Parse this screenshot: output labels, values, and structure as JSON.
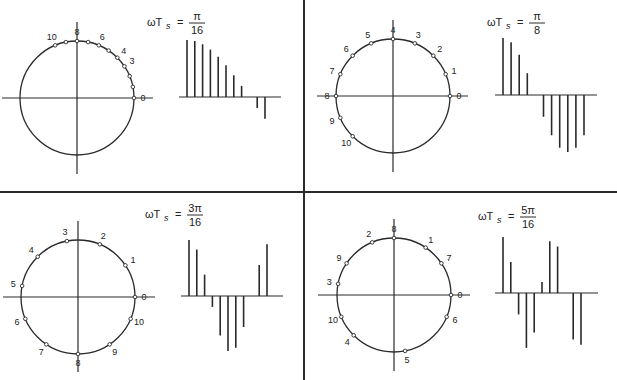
{
  "figure": {
    "colors": {
      "ink": "#2a2a2a",
      "background": "#ffffff"
    }
  },
  "panels": [
    {
      "id": "top-left",
      "title": {
        "lhs": "ωT",
        "sub": "s",
        "eq": "=",
        "num": "π",
        "den": "16"
      },
      "omega_ts_over_pi": 0.0625,
      "samples": [
        0,
        1,
        2,
        3,
        4,
        5,
        6,
        7,
        8,
        9,
        10
      ],
      "point_labels": [
        "0",
        "3",
        "4",
        "6",
        "8",
        "10"
      ],
      "point_label_indices": [
        0,
        3,
        4,
        6,
        8,
        10
      ],
      "stem_values": [
        1.0,
        0.981,
        0.924,
        0.831,
        0.707,
        0.556,
        0.383,
        0.195,
        0.0,
        -0.195,
        -0.383
      ]
    },
    {
      "id": "top-right",
      "title": {
        "lhs": "ωT",
        "sub": "s",
        "eq": "=",
        "num": "π",
        "den": "8"
      },
      "omega_ts_over_pi": 0.125,
      "samples": [
        0,
        1,
        2,
        3,
        4,
        5,
        6,
        7,
        8,
        9,
        10
      ],
      "point_labels": [
        "0",
        "1",
        "2",
        "3",
        "4",
        "5",
        "6",
        "7",
        "8",
        "9",
        "10"
      ],
      "point_label_indices": [
        0,
        1,
        2,
        3,
        4,
        5,
        6,
        7,
        8,
        9,
        10
      ],
      "stem_values": [
        1.0,
        0.924,
        0.707,
        0.383,
        0.0,
        -0.383,
        -0.707,
        -0.924,
        -1.0,
        -0.924,
        -0.707
      ]
    },
    {
      "id": "bottom-left",
      "title": {
        "lhs": "ωT",
        "sub": "s",
        "eq": "=",
        "num": "3π",
        "den": "16"
      },
      "omega_ts_over_pi": 0.1875,
      "samples": [
        0,
        1,
        2,
        3,
        4,
        5,
        6,
        7,
        8,
        9,
        10
      ],
      "point_labels": [
        "0",
        "1",
        "2",
        "3",
        "4",
        "5",
        "6",
        "7",
        "8",
        "9",
        "10"
      ],
      "point_label_indices": [
        0,
        1,
        2,
        3,
        4,
        5,
        6,
        7,
        8,
        9,
        10
      ],
      "stem_values": [
        1.0,
        0.831,
        0.383,
        -0.195,
        -0.707,
        -0.981,
        -0.924,
        -0.556,
        0.0,
        0.556,
        0.924
      ]
    },
    {
      "id": "bottom-right",
      "title": {
        "lhs": "ωT",
        "sub": "s",
        "eq": "=",
        "num": "5π",
        "den": "16"
      },
      "omega_ts_over_pi": 0.3125,
      "samples": [
        0,
        1,
        2,
        3,
        4,
        5,
        6,
        7,
        8,
        9,
        10
      ],
      "point_labels": [
        "0",
        "1",
        "2",
        "3",
        "4",
        "5",
        "6",
        "7",
        "8",
        "9",
        "10"
      ],
      "point_label_indices": [
        0,
        1,
        2,
        3,
        4,
        5,
        6,
        7,
        8,
        9,
        10
      ],
      "stem_values": [
        1.0,
        0.556,
        -0.383,
        -0.981,
        -0.707,
        0.195,
        0.924,
        0.831,
        0.0,
        -0.831,
        -0.924
      ]
    }
  ]
}
